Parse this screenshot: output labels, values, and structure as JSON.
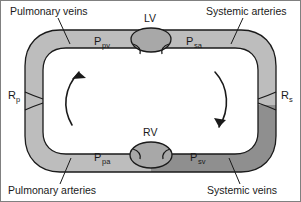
{
  "figure": {
    "frame_color": "#808080",
    "background": "#ffffff",
    "outline_color": "#1a1a1a"
  },
  "corner_labels": {
    "top_left": "Pulmonary veins",
    "top_right": "Systemic arteries",
    "bottom_left": "Pulmonary arteries",
    "bottom_right": "Systemic veins"
  },
  "chambers": [
    {
      "id": "lv",
      "label": "LV",
      "fill": "#a8a8a8"
    },
    {
      "id": "rv",
      "label": "RV",
      "fill": "#a8a8a8"
    }
  ],
  "pressures": [
    {
      "id": "p-pv",
      "symbol": "P",
      "subscript": "pv",
      "segment": "pulmonary-veins",
      "fill": "#bdbdbd"
    },
    {
      "id": "p-sa",
      "symbol": "P",
      "subscript": "sa",
      "segment": "systemic-arteries",
      "fill": "#bdbdbd"
    },
    {
      "id": "p-pa",
      "symbol": "P",
      "subscript": "pa",
      "segment": "pulmonary-arteries",
      "fill": "#bdbdbd"
    },
    {
      "id": "p-sv",
      "symbol": "P",
      "subscript": "sv",
      "segment": "systemic-veins",
      "fill": "#8f8f8f"
    }
  ],
  "resistances": [
    {
      "id": "r-p",
      "symbol": "R",
      "subscript": "p",
      "side": "left"
    },
    {
      "id": "r-s",
      "symbol": "R",
      "subscript": "s",
      "side": "right"
    }
  ],
  "flow_arrows": [
    {
      "id": "arrow-left",
      "direction": "upward",
      "side": "left"
    },
    {
      "id": "arrow-right",
      "direction": "downward",
      "side": "right"
    }
  ],
  "vessel_colors": {
    "light_gray": "#bdbdbd",
    "mid_gray": "#a8a8a8",
    "dark_gray": "#8f8f8f"
  }
}
